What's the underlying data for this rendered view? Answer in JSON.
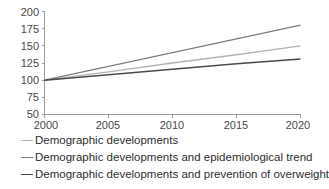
{
  "chart_data": {
    "type": "line",
    "title": "",
    "xlabel": "",
    "ylabel": "",
    "x": [
      2000,
      2005,
      2010,
      2015,
      2020
    ],
    "xlim": [
      2000,
      2020
    ],
    "ylim": [
      50,
      200
    ],
    "y_ticks": [
      50,
      75,
      100,
      125,
      150,
      175,
      200
    ],
    "x_ticks": [
      2000,
      2005,
      2010,
      2015,
      2020
    ],
    "grid": false,
    "legend_position": "below",
    "series": [
      {
        "name": "Demographic developments",
        "color": "#b4b4b4",
        "width": 1.3,
        "values": [
          100,
          112,
          125,
          137,
          150
        ]
      },
      {
        "name": "Demographic developments and epidemiological trend",
        "color": "#7d7d7d",
        "width": 1.3,
        "values": [
          100,
          120,
          140,
          160,
          180
        ]
      },
      {
        "name": "Demographic developments and prevention of overweight",
        "color": "#4a4a4a",
        "width": 1.5,
        "values": [
          100,
          108,
          116,
          124,
          131
        ]
      }
    ]
  },
  "axis": {
    "y_tick_labels": [
      "200",
      "175",
      "150",
      "125",
      "100",
      "75",
      "50"
    ],
    "x_tick_labels": [
      "2000",
      "2005",
      "2010",
      "2015",
      "2020"
    ]
  },
  "legend": {
    "items": [
      {
        "label": "Demographic developments"
      },
      {
        "label": "Demographic developments and epidemiological trend"
      },
      {
        "label": "Demographic developments and prevention of overweight"
      }
    ]
  }
}
